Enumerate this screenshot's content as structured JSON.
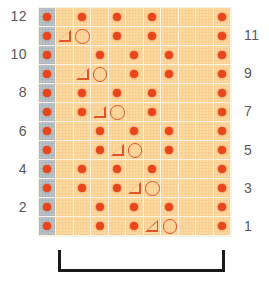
{
  "chart_data": {
    "type": "heatmap",
    "title": "",
    "xlabel": "",
    "ylabel": "",
    "grid": {
      "columns": 11,
      "rows": 12
    },
    "legend": [
      {
        "symbol": "dot",
        "name": "purl-dot"
      },
      {
        "symbol": "triangle",
        "name": "decrease-triangle"
      },
      {
        "symbol": "circle",
        "name": "yarn-over-circle"
      }
    ],
    "column_types": [
      "selvage",
      "pattern",
      "pattern",
      "pattern",
      "pattern",
      "pattern",
      "pattern",
      "pattern",
      "pattern",
      "pattern",
      "pattern"
    ],
    "row_numbers_left": [
      "12",
      "",
      "10",
      "",
      "8",
      "",
      "6",
      "",
      "4",
      "",
      "2",
      ""
    ],
    "row_numbers_right": [
      "",
      "11",
      "",
      "9",
      "",
      "7",
      "",
      "5",
      "",
      "3",
      "",
      "1"
    ],
    "rows": [
      {
        "row": 12,
        "cells": [
          "dot",
          "",
          "dot",
          "",
          "dot",
          "",
          "dot",
          "",
          "",
          "",
          "dot"
        ]
      },
      {
        "row": 11,
        "cells": [
          "dot",
          "triangle",
          "circle",
          "",
          "dot",
          "",
          "dot",
          "",
          "",
          "",
          "dot"
        ]
      },
      {
        "row": 10,
        "cells": [
          "dot",
          "",
          "",
          "dot",
          "",
          "dot",
          "",
          "dot",
          "",
          "",
          "dot"
        ]
      },
      {
        "row": 9,
        "cells": [
          "dot",
          "",
          "triangle",
          "circle",
          "",
          "dot",
          "",
          "dot",
          "",
          "",
          "dot"
        ]
      },
      {
        "row": 8,
        "cells": [
          "dot",
          "",
          "dot",
          "",
          "dot",
          "",
          "dot",
          "",
          "",
          "",
          "dot"
        ]
      },
      {
        "row": 7,
        "cells": [
          "dot",
          "",
          "dot",
          "triangle",
          "circle",
          "",
          "dot",
          "",
          "",
          "",
          "dot"
        ]
      },
      {
        "row": 6,
        "cells": [
          "dot",
          "",
          "",
          "dot",
          "",
          "dot",
          "",
          "dot",
          "",
          "",
          "dot"
        ]
      },
      {
        "row": 5,
        "cells": [
          "dot",
          "",
          "",
          "dot",
          "triangle",
          "circle",
          "",
          "dot",
          "",
          "",
          "dot"
        ]
      },
      {
        "row": 4,
        "cells": [
          "dot",
          "",
          "dot",
          "",
          "dot",
          "",
          "dot",
          "",
          "",
          "",
          "dot"
        ]
      },
      {
        "row": 3,
        "cells": [
          "dot",
          "",
          "dot",
          "",
          "dot",
          "triangle",
          "circle",
          "",
          "",
          "",
          "dot"
        ]
      },
      {
        "row": 2,
        "cells": [
          "dot",
          "",
          "",
          "dot",
          "",
          "dot",
          "",
          "dot",
          "",
          "",
          "dot"
        ]
      },
      {
        "row": 1,
        "cells": [
          "dot",
          "",
          "",
          "dot",
          "",
          "dot",
          "triangle",
          "circle",
          "",
          "",
          "dot"
        ]
      }
    ],
    "repeat_bracket": {
      "label": "",
      "from_column": 2,
      "to_column": 10
    },
    "colors": {
      "grid_background": "#fbd9a0",
      "selvage_background": "#b9c3c8",
      "gridline": "#fdf4e3",
      "dot": "#e8461a",
      "symbol_outline": "#e0542a",
      "row_number_text": "#58585a",
      "bracket": "#1a1a1a"
    }
  }
}
